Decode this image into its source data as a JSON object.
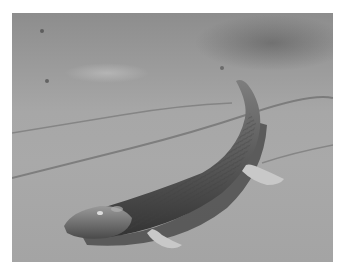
{
  "image": {
    "subject": "Tiktaalik-like lobe-finned fish crawling on a mudflat",
    "style": "grayscale photograph",
    "colors": {
      "border": "#ffffff",
      "mud_light": "#a9a9a9",
      "mud_dark": "#7a7a7a",
      "water": "#8d8d8d",
      "creature_body": "#5a5a5a",
      "creature_shadow": "#3a3a3a",
      "fin_highlight": "#c8c8c8"
    }
  }
}
